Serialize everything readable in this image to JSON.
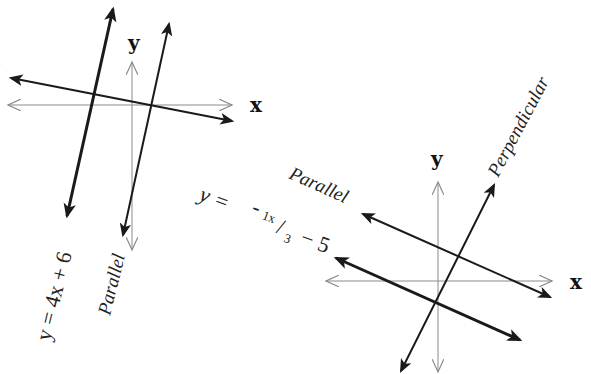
{
  "diagram": {
    "graph1": {
      "x_axis_label": "x",
      "y_axis_label": "y",
      "given_line_label": "y = 4x + 6",
      "parallel_label": "Parallel",
      "perpendicular_label_visible": "r"
    },
    "graph2": {
      "x_axis_label": "x",
      "y_axis_label": "y",
      "given_line_label": {
        "prefix": "y =",
        "minus": "-",
        "numerator": "1x",
        "slash": "/",
        "denominator": "3",
        "suffix": "− 5"
      },
      "parallel_label": "Parallel",
      "perpendicular_label": "Perpendicular"
    },
    "colors": {
      "line": "#1a1a1a",
      "axis": "#8a8a8a",
      "background": "#ffffff"
    }
  }
}
